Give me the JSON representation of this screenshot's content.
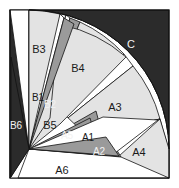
{
  "figure": {
    "background_color": "#2b2b2b",
    "page_color": "#ffffff",
    "stroke_color": "#111111",
    "palette": {
      "dark": "#2b2b2b",
      "light_gray": "#e3e3e3",
      "mid_gray": "#9a9a9a",
      "white": "#ffffff"
    },
    "frame": {
      "x": 10,
      "y": 10,
      "width": 159,
      "height": 168
    },
    "fan_apex": {
      "x": 29,
      "y": 149
    },
    "arc_radius": 140
  },
  "regions": [
    {
      "id": "C",
      "label": "C",
      "fill": "#2b2b2b",
      "label_color": "light",
      "label_x": 131,
      "label_y": 45,
      "role": "outer-complement"
    },
    {
      "id": "B3",
      "label": "B3",
      "fill": "#e3e3e3",
      "label_color": "dark",
      "label_x": 39,
      "label_y": 50,
      "role": "wedge"
    },
    {
      "id": "B4",
      "label": "B4",
      "fill": "#e3e3e3",
      "label_color": "dark",
      "label_x": 78,
      "label_y": 69,
      "role": "wedge"
    },
    {
      "id": "B1",
      "label": "B1",
      "fill": "#ffffff",
      "label_color": "dark",
      "label_x": 38,
      "label_y": 98,
      "role": "wedge"
    },
    {
      "id": "B2",
      "label": "B2",
      "fill": "#9a9a9a",
      "label_color": "light",
      "label_x": 49,
      "label_y": 105,
      "role": "wedge"
    },
    {
      "id": "B5",
      "label": "B5",
      "fill": "#ffffff",
      "label_color": "dark",
      "label_x": 50,
      "label_y": 126,
      "role": "wedge"
    },
    {
      "id": "B6",
      "label": "B6",
      "fill": "#2b2b2b",
      "label_color": "light",
      "label_x": 16,
      "label_y": 126,
      "role": "wedge"
    },
    {
      "id": "A3",
      "label": "A3",
      "fill": "#e3e3e3",
      "label_color": "dark",
      "label_x": 115,
      "label_y": 108,
      "role": "wedge"
    },
    {
      "id": "A5",
      "label": "A5",
      "fill": "#9a9a9a",
      "label_color": "light",
      "label_x": 67,
      "label_y": 136,
      "role": "wedge"
    },
    {
      "id": "A1",
      "label": "A1",
      "fill": "#ffffff",
      "label_color": "dark",
      "label_x": 87,
      "label_y": 138,
      "role": "wedge"
    },
    {
      "id": "A2",
      "label": "A2",
      "fill": "#9a9a9a",
      "label_color": "light",
      "label_x": 98,
      "label_y": 152,
      "role": "wedge"
    },
    {
      "id": "A4",
      "label": "A4",
      "fill": "#e3e3e3",
      "label_color": "dark",
      "label_x": 139,
      "label_y": 153,
      "role": "wedge"
    },
    {
      "id": "A6",
      "label": "A6",
      "fill": "#ffffff",
      "label_color": "dark",
      "label_x": 62,
      "label_y": 171,
      "role": "wedge"
    }
  ],
  "geometry": {
    "note": "Polygon point lists in pixel coordinates of the 179x188 canvas.",
    "shapes": {
      "C": "169,10 10,10 10,22 54,18 95,34 131,66 155,105 166,150 169,178",
      "B3": "29,149 28,28 62,21 50,119",
      "B4": "29,149 66,22 119,52 57,128",
      "B1": "29,149 45,87 49,112",
      "B2": "29,149 49,90 56,114",
      "B5": "29,149 58,116 79,141",
      "B6": "29,149 11,76 11,168",
      "A3": "29,149 123,55 157,119 92,146",
      "A5": "29,149 88,120 99,156",
      "A1": "29,149 101,119 113,152",
      "A2": "29,149 104,138 117,156",
      "A4": "29,149 160,128 168,177",
      "A6": "29,149 168,178 18,178"
    }
  }
}
